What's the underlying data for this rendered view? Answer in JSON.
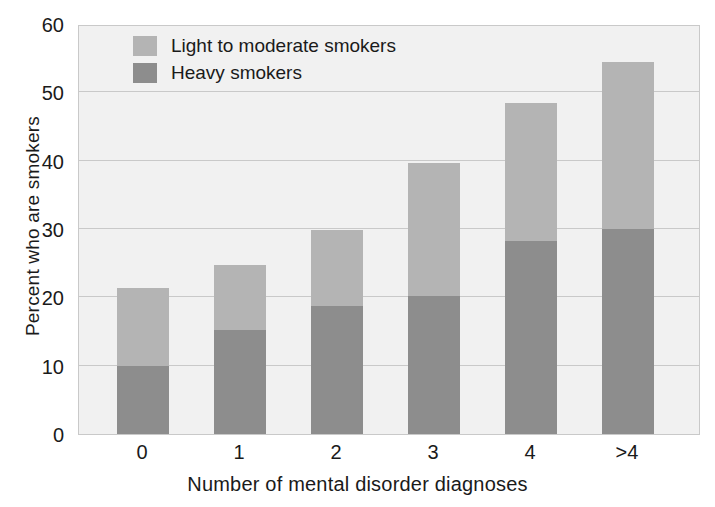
{
  "chart_data": {
    "type": "bar",
    "subtype": "stacked-vertical",
    "title": "",
    "xlabel": "Number of mental disorder diagnoses",
    "ylabel": "Percent who are smokers",
    "categories": [
      "0",
      "1",
      "2",
      "3",
      "4",
      ">4"
    ],
    "ylim": [
      0,
      60
    ],
    "yticks": [
      0,
      10,
      20,
      30,
      40,
      50,
      60
    ],
    "ytick_labels": [
      "0",
      "10",
      "20",
      "30",
      "40",
      "50",
      "60"
    ],
    "grid": "horizontal",
    "legend_position": "top-left-inside",
    "series": [
      {
        "name": "Heavy smokers",
        "color": "#8d8d8d",
        "values": [
          10.0,
          15.2,
          18.8,
          20.2,
          28.3,
          30.0
        ]
      },
      {
        "name": "Light to moderate smokers",
        "color": "#b4b4b4",
        "values": [
          11.3,
          9.6,
          11.0,
          19.4,
          20.2,
          24.5
        ]
      }
    ],
    "totals": [
      21.3,
      24.8,
      29.8,
      39.6,
      48.5,
      54.5
    ],
    "plot_background": "#f1f1f1",
    "gridline_color": "#c9c9c9",
    "axis_color": "#c9c9c9",
    "text_color": "#1a1a1a"
  },
  "legend": {
    "items": [
      {
        "label": "Light to moderate smokers",
        "color": "#b4b4b4"
      },
      {
        "label": "Heavy smokers",
        "color": "#8d8d8d"
      }
    ]
  }
}
